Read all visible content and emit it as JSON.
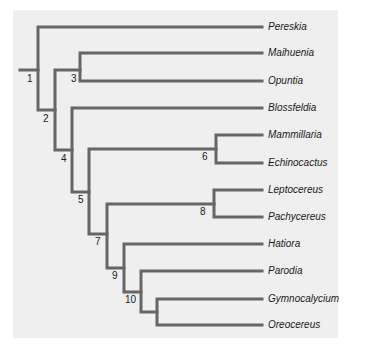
{
  "diagram": {
    "type": "phylogenetic-tree",
    "line_color": "#666666",
    "background_color": "#efefef",
    "leaves": [
      {
        "name": "Pereskia",
        "y": 27
      },
      {
        "name": "Maihuenia",
        "y": 53
      },
      {
        "name": "Opuntia",
        "y": 81
      },
      {
        "name": "Blossfeldia",
        "y": 108
      },
      {
        "name": "Mammillaria",
        "y": 135
      },
      {
        "name": "Echinocactus",
        "y": 163
      },
      {
        "name": "Leptocereus",
        "y": 190
      },
      {
        "name": "Pachycereus",
        "y": 217
      },
      {
        "name": "Hatiora",
        "y": 244
      },
      {
        "name": "Parodia",
        "y": 271
      },
      {
        "name": "Gymnocalycium",
        "y": 299
      },
      {
        "name": "Oreocereus",
        "y": 325
      }
    ],
    "nodes": [
      {
        "label": "1",
        "x": 38,
        "y": 70,
        "lx": 26,
        "ly": 72
      },
      {
        "label": "2",
        "x": 55,
        "y": 110,
        "lx": 43,
        "ly": 112
      },
      {
        "label": "3",
        "x": 80,
        "y": 70,
        "lx": 70,
        "ly": 72
      },
      {
        "label": "4",
        "x": 72,
        "y": 150,
        "lx": 61,
        "ly": 152
      },
      {
        "label": "5",
        "x": 89,
        "y": 192,
        "lx": 78,
        "ly": 194
      },
      {
        "label": "6",
        "x": 216,
        "y": 149,
        "lx": 202,
        "ly": 151
      },
      {
        "label": "7",
        "x": 107,
        "y": 234,
        "lx": 95,
        "ly": 236
      },
      {
        "label": "8",
        "x": 214,
        "y": 204,
        "lx": 200,
        "ly": 206
      },
      {
        "label": "9",
        "x": 124,
        "y": 268,
        "lx": 112,
        "ly": 270
      },
      {
        "label": "10",
        "x": 141,
        "y": 292,
        "lx": 125,
        "ly": 294
      }
    ]
  }
}
